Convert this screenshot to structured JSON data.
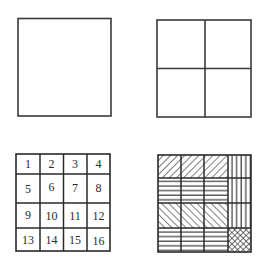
{
  "panels": [
    {
      "id": "whole-square",
      "description": "single undivided square"
    },
    {
      "id": "quartered-square",
      "description": "square divided into 2x2 cells"
    },
    {
      "id": "numbered-grid",
      "description": "square divided into 4x4 numbered cells",
      "cells": [
        "1",
        "2",
        "3",
        "4",
        "5",
        "6",
        "7",
        "8",
        "9",
        "10",
        "11",
        "12",
        "13",
        "14",
        "15",
        "16"
      ]
    },
    {
      "id": "patterned-grid",
      "description": "4x4 grid with hatch patterns",
      "patterns": [
        [
          "diagonal-forward",
          "diagonal-forward",
          "diagonal-forward",
          "vertical"
        ],
        [
          "horizontal",
          "horizontal",
          "horizontal",
          "vertical"
        ],
        [
          "diagonal-backward",
          "diagonal-backward",
          "diagonal-backward",
          "vertical"
        ],
        [
          "horizontal",
          "horizontal",
          "horizontal",
          "crosshatch"
        ]
      ]
    }
  ],
  "colors": {
    "line": "#2a2a2a",
    "background": "#ffffff"
  }
}
